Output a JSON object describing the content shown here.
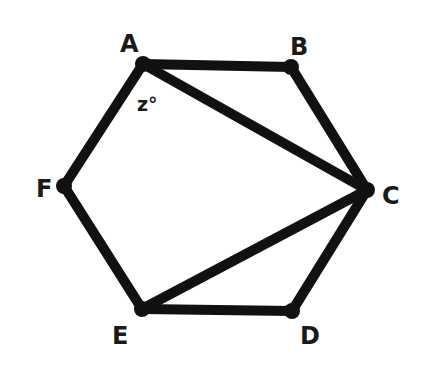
{
  "figure": {
    "type": "geometry",
    "stroke_color": "#111111",
    "background": "#ffffff",
    "vertices": [
      {
        "name": "A",
        "x": 143,
        "y": 64,
        "label_x": 120,
        "label_y": 52
      },
      {
        "name": "B",
        "x": 291,
        "y": 67,
        "label_x": 290,
        "label_y": 55
      },
      {
        "name": "C",
        "x": 367,
        "y": 190,
        "label_x": 382,
        "label_y": 204
      },
      {
        "name": "D",
        "x": 292,
        "y": 311,
        "label_x": 300,
        "label_y": 344
      },
      {
        "name": "E",
        "x": 142,
        "y": 309,
        "label_x": 112,
        "label_y": 344
      },
      {
        "name": "F",
        "x": 64,
        "y": 186,
        "label_x": 36,
        "label_y": 197
      }
    ],
    "edges": [
      [
        "A",
        "B"
      ],
      [
        "B",
        "C"
      ],
      [
        "C",
        "D"
      ],
      [
        "D",
        "E"
      ],
      [
        "E",
        "F"
      ],
      [
        "F",
        "A"
      ],
      [
        "A",
        "C"
      ],
      [
        "E",
        "C"
      ]
    ],
    "angle_label": {
      "text": "z°",
      "vertex": "A",
      "x": 137,
      "y": 111
    }
  }
}
